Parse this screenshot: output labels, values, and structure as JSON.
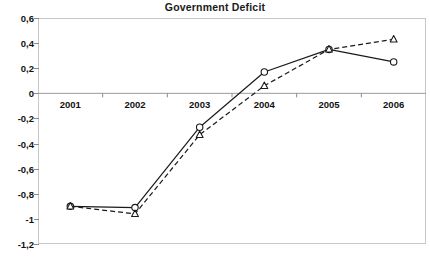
{
  "chart_data": {
    "type": "line",
    "title": "Government Deficit",
    "xlabel": "",
    "ylabel": "",
    "categories": [
      "2001",
      "2002",
      "2003",
      "2004",
      "2005",
      "2006"
    ],
    "ylim": [
      -1.2,
      0.6
    ],
    "ytick_labels": [
      "0,6",
      "0,4",
      "0,2",
      "0",
      "-0,2",
      "-0,4",
      "-0,6",
      "-0,8",
      "-1",
      "-1,2"
    ],
    "ytick_values": [
      0.6,
      0.4,
      0.2,
      0,
      -0.2,
      -0.4,
      -0.6,
      -0.8,
      -1.0,
      -1.2
    ],
    "grid": false,
    "zero_line": true,
    "legend": "none",
    "series": [
      {
        "name": "series-1-solid-circle",
        "line_style": "solid",
        "marker": "circle-open",
        "color": "#1a1a1a",
        "values": [
          -0.9,
          -0.91,
          -0.27,
          0.17,
          0.35,
          0.25
        ]
      },
      {
        "name": "series-2-dashed-triangle",
        "line_style": "dashed",
        "marker": "triangle-open",
        "color": "#1a1a1a",
        "values": [
          -0.9,
          -0.96,
          -0.33,
          0.06,
          0.35,
          0.43
        ]
      }
    ],
    "colors": {
      "axis": "#8a8a8a",
      "frame": "#c8c8c8",
      "zero_line": "#9a9a9a",
      "text": "#111111",
      "background": "#ffffff"
    }
  }
}
